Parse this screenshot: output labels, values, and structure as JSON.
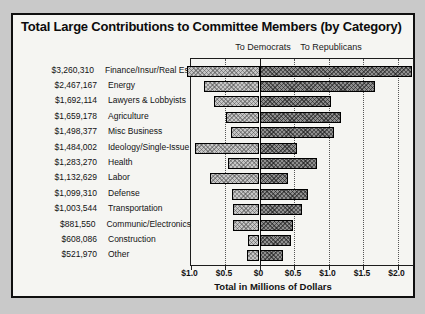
{
  "title": "Total Large Contributions to Committee Members (by Category)",
  "colors": {
    "page_background": "#c9c9c9",
    "panel_background": "#f5f5f2",
    "democrat_bar": "#c6c6c6",
    "republican_bar": "#8f8f8f",
    "ink": "#111111"
  },
  "chart_data": {
    "type": "bar",
    "orientation": "horizontal-diverging",
    "title": "Total Large Contributions to Committee Members (by Category)",
    "left_header": "To Democrats",
    "right_header": "To Republicans",
    "xlabel": "Total in Millions of Dollars",
    "xlim": [
      -1.0,
      2.25
    ],
    "grid": "vertical-dotted",
    "axis_ticks": [
      {
        "label": "$1.0",
        "value": -1.0
      },
      {
        "label": "$0.5",
        "value": -0.5
      },
      {
        "label": "$0",
        "value": 0.0
      },
      {
        "label": "$0.5",
        "value": 0.5
      },
      {
        "label": "$1.0",
        "value": 1.0
      },
      {
        "label": "$1.5",
        "value": 1.5
      },
      {
        "label": "$2.0",
        "value": 2.0
      }
    ],
    "categories": [
      "Finance/Insur/Real Est",
      "Energy",
      "Lawyers & Lobbyists",
      "Agriculture",
      "Misc Business",
      "Ideology/Single-Issue",
      "Health",
      "Labor",
      "Defense",
      "Transportation",
      "Communic/Electronics",
      "Construction",
      "Other"
    ],
    "totals": [
      "$3,260,310",
      "$2,467,167",
      "$1,692,114",
      "$1,659,178",
      "$1,498,377",
      "$1,484,002",
      "$1,283,270",
      "$1,132,629",
      "$1,099,310",
      "$1,003,544",
      "$881,550",
      "$608,086",
      "$521,970"
    ],
    "series": [
      {
        "name": "To Democrats",
        "values": [
          1.05,
          0.8,
          0.66,
          0.48,
          0.42,
          0.93,
          0.45,
          0.72,
          0.4,
          0.38,
          0.39,
          0.16,
          0.18
        ]
      },
      {
        "name": "To Republicans",
        "values": [
          2.21,
          1.67,
          1.03,
          1.18,
          1.08,
          0.55,
          0.83,
          0.41,
          0.7,
          0.62,
          0.49,
          0.45,
          0.34
        ]
      }
    ]
  }
}
